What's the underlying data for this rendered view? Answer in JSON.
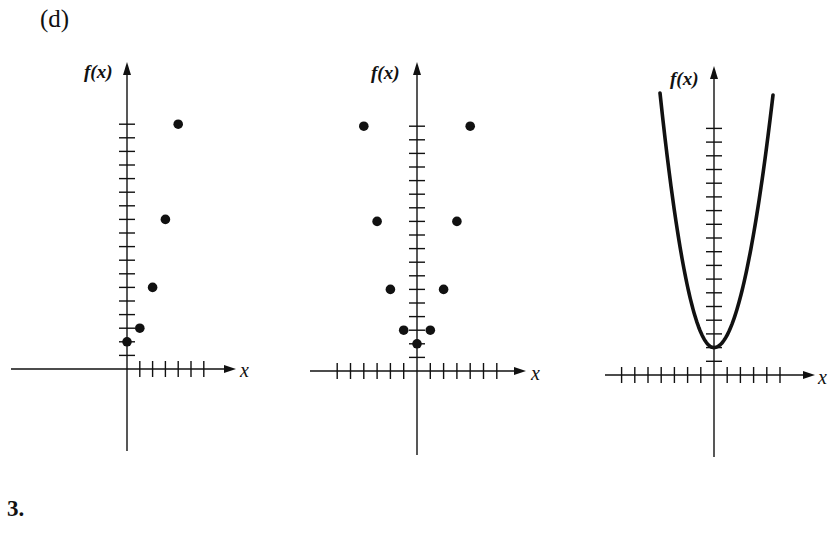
{
  "part_label": "(d)",
  "problem_number": "3.",
  "colors": {
    "ink": "#111111",
    "background": "#ffffff"
  },
  "chart_data": [
    {
      "type": "scatter",
      "title": "",
      "xlabel": "x",
      "ylabel": "f(x)",
      "description": "Points of f(x)=x^2+2 for non-negative x",
      "x": [
        0,
        1,
        2,
        3,
        4
      ],
      "values": [
        2,
        3,
        6,
        11,
        18
      ],
      "x_ticks_negative": 0,
      "x_ticks_positive": 6,
      "y_ticks": 18,
      "grid": false,
      "layout": {
        "ox": 127,
        "oy": 369,
        "dx": 12.8,
        "dy": 13.6,
        "xmin_px": 11,
        "xmax_px": 236,
        "ytop_px": 62,
        "ybot_px": 451,
        "fx_label_x": 84,
        "fx_label_y": 78,
        "x_label_x": 240,
        "x_label_y": 377
      }
    },
    {
      "type": "scatter",
      "title": "",
      "xlabel": "x",
      "ylabel": "f(x)",
      "description": "Points of f(x)=x^2+2 for x from -4 to 4",
      "x": [
        -4,
        -3,
        -2,
        -1,
        0,
        1,
        2,
        3,
        4
      ],
      "values": [
        18,
        11,
        6,
        3,
        2,
        3,
        6,
        11,
        18
      ],
      "x_ticks_negative": 6,
      "x_ticks_positive": 6,
      "y_ticks": 18,
      "grid": false,
      "layout": {
        "ox": 417,
        "oy": 371,
        "dx": 13.3,
        "dy": 13.6,
        "xmin_px": 310,
        "xmax_px": 526,
        "ytop_px": 62,
        "ybot_px": 455,
        "fx_label_x": 371,
        "fx_label_y": 79,
        "x_label_x": 531,
        "x_label_y": 380
      }
    },
    {
      "type": "line",
      "title": "",
      "xlabel": "x",
      "ylabel": "f(x)",
      "description": "Continuous parabola f(x)=x^2+2",
      "x_range": [
        -4.2,
        4.2
      ],
      "formula": "x^2+2",
      "vertex": [
        0,
        2
      ],
      "x_ticks_negative": 7,
      "x_ticks_positive": 5,
      "y_ticks": 18,
      "grid": false,
      "layout": {
        "ox": 714,
        "oy": 375,
        "dx": 13.2,
        "dy": 13.7,
        "xmin_px": 605,
        "xmax_px": 815,
        "ytop_px": 66,
        "ybot_px": 457,
        "fx_label_x": 670,
        "fx_label_y": 85,
        "x_label_x": 818,
        "x_label_y": 384,
        "curve_left": [
          660,
          93
        ],
        "curve_right": [
          773,
          95
        ]
      }
    }
  ]
}
